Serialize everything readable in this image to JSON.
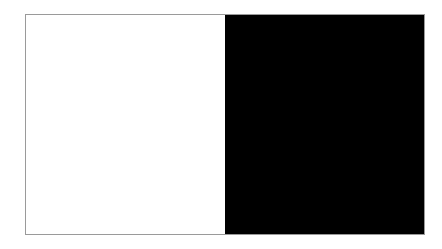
{
  "page": {
    "background_color": "#ffffff",
    "width": 442,
    "height": 249
  },
  "figure": {
    "name": "two-tone-contrast-panel",
    "border_color": "#9a9a9a",
    "border_width": 1,
    "left": 25,
    "top": 14,
    "width": 400,
    "height": 221,
    "panels": [
      {
        "id": "left",
        "label": "",
        "fill_color": "#ffffff",
        "width_fraction": 0.5
      },
      {
        "id": "right",
        "label": "",
        "fill_color": "#000000",
        "width_fraction": 0.5
      }
    ]
  }
}
